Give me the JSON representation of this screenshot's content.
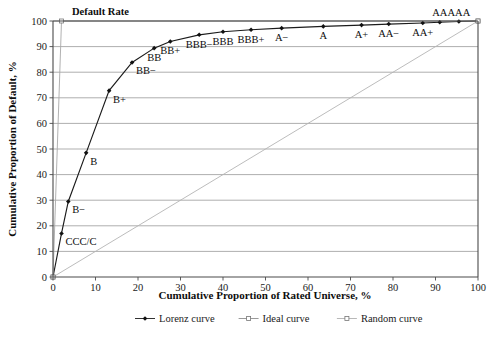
{
  "chart_data": {
    "type": "line",
    "title": "",
    "xlabel": "Cumulative Proportion of Rated Universe, %",
    "ylabel": "Cumulative Proportion of Default, %",
    "xlim": [
      0,
      100
    ],
    "ylim": [
      0,
      100
    ],
    "xticks": [
      0,
      10,
      20,
      30,
      40,
      50,
      60,
      70,
      80,
      90,
      100
    ],
    "yticks": [
      0,
      10,
      20,
      30,
      40,
      50,
      60,
      70,
      80,
      90,
      100
    ],
    "grid": "horizontal",
    "legend_position": "bottom-center",
    "annotations": [
      {
        "text": "Default Rate",
        "x": 4.0,
        "y": 104.5,
        "bold": true
      }
    ],
    "series": [
      {
        "name": "Lorenz curve",
        "marker": "filled-diamond",
        "color": "#1b1b1b",
        "points": [
          {
            "label": "",
            "x": 0.0,
            "y": 0.0
          },
          {
            "label": "CCC/C",
            "x": 2.0,
            "y": 17.0
          },
          {
            "label": "B−",
            "x": 3.6,
            "y": 29.5
          },
          {
            "label": "B",
            "x": 7.8,
            "y": 48.5
          },
          {
            "label": "B+",
            "x": 13.2,
            "y": 72.8
          },
          {
            "label": "BB−",
            "x": 18.6,
            "y": 83.8
          },
          {
            "label": "BB",
            "x": 23.8,
            "y": 89.4
          },
          {
            "label": "BB+",
            "x": 27.6,
            "y": 92.0
          },
          {
            "label": "BBB−",
            "x": 34.4,
            "y": 94.6
          },
          {
            "label": "BBB",
            "x": 40.0,
            "y": 95.8
          },
          {
            "label": "BBB+",
            "x": 46.6,
            "y": 96.6
          },
          {
            "label": "A−",
            "x": 53.8,
            "y": 97.2
          },
          {
            "label": "A",
            "x": 63.6,
            "y": 97.9
          },
          {
            "label": "A+",
            "x": 72.6,
            "y": 98.4
          },
          {
            "label": "AA−",
            "x": 79.0,
            "y": 98.8
          },
          {
            "label": "AA+",
            "x": 87.0,
            "y": 99.2
          },
          {
            "label": "AA",
            "x": 91.0,
            "y": 99.5
          },
          {
            "label": "AAA",
            "x": 95.5,
            "y": 99.8
          },
          {
            "label": "",
            "x": 100.0,
            "y": 100.0
          }
        ]
      },
      {
        "name": "Ideal curve",
        "marker": "open-square",
        "color": "#a8a8a8",
        "points": [
          {
            "x": 0.0,
            "y": 0.0
          },
          {
            "x": 2.0,
            "y": 100.0
          },
          {
            "x": 100.0,
            "y": 100.0
          }
        ]
      },
      {
        "name": "Random curve",
        "marker": "open-square",
        "color": "#b4b4b4",
        "points": [
          {
            "x": 0.0,
            "y": 0.0
          },
          {
            "x": 100.0,
            "y": 100.0
          }
        ]
      }
    ]
  },
  "legend": {
    "items": [
      {
        "label": "Lorenz curve",
        "marker": "filled-diamond",
        "color": "#1b1b1b"
      },
      {
        "label": "Ideal curve",
        "marker": "open-square",
        "color": "#8f8f8f"
      },
      {
        "label": "Random curve",
        "marker": "open-square",
        "color": "#b0b0b0"
      }
    ]
  },
  "labels": {
    "point_labels": {
      "ccc_c": "CCC/C",
      "b_minus": "B−",
      "b": "B",
      "b_plus": "B+",
      "bb_minus": "BB−",
      "bb": "BB",
      "bb_plus": "BB+",
      "bbb_minus": "BBB−",
      "bbb": "BBB",
      "bbb_plus": "BBB+",
      "a_minus": "A−",
      "a": "A",
      "a_plus": "A+",
      "aa_minus": "AA−",
      "aa_plus": "AA+",
      "aa": "AA",
      "aaa": "AAA"
    },
    "default_rate": "Default Rate"
  }
}
